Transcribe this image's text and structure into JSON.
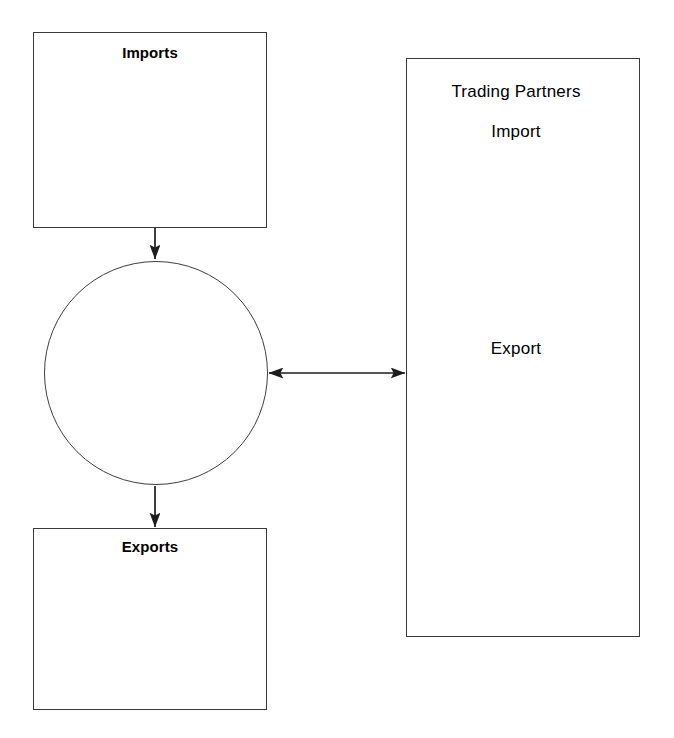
{
  "diagram": {
    "background_color": "#ffffff",
    "stroke_color": "#1d1d1d",
    "box_border_color": "#3a3a3a",
    "nodes": {
      "imports_box": {
        "label": "Imports",
        "shape": "rectangle",
        "x": 33,
        "y": 32,
        "width": 234,
        "height": 196,
        "label_x": 150,
        "label_y": 52,
        "bold": true
      },
      "process_circle": {
        "label": "",
        "shape": "circle",
        "cx": 156,
        "cy": 373,
        "r": 112
      },
      "exports_box": {
        "label": "Exports",
        "shape": "rectangle",
        "x": 33,
        "y": 528,
        "width": 234,
        "height": 182,
        "label_x": 150,
        "label_y": 546,
        "bold": true
      },
      "trading_partners_box": {
        "shape": "rectangle",
        "x": 406,
        "y": 58,
        "width": 234,
        "height": 579,
        "labels": [
          {
            "text": "Trading Partners",
            "x": 516,
            "y": 91
          },
          {
            "text": "Import",
            "x": 516,
            "y": 131
          },
          {
            "text": "Export",
            "x": 516,
            "y": 348
          }
        ]
      }
    },
    "edges": [
      {
        "name": "imports-to-circle",
        "from": "imports_box",
        "to": "process_circle",
        "direction": "down",
        "arrowheads": "end",
        "x1": 155,
        "y1": 228,
        "x2": 155,
        "y2": 259
      },
      {
        "name": "circle-to-exports",
        "from": "process_circle",
        "to": "exports_box",
        "direction": "down",
        "arrowheads": "end",
        "x1": 155,
        "y1": 486,
        "x2": 155,
        "y2": 527
      },
      {
        "name": "circle-to-trading-partners",
        "from": "process_circle",
        "to": "trading_partners_box",
        "direction": "horizontal",
        "arrowheads": "both",
        "x1": 269,
        "y1": 373,
        "x2": 405,
        "y2": 373
      }
    ]
  }
}
